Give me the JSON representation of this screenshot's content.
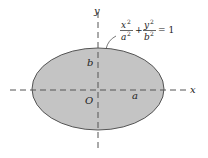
{
  "diagram": {
    "type": "ellipse",
    "fill_color": "#c4c4c4",
    "stroke_color": "#555555",
    "axis_color": "#555555",
    "labels": {
      "x_axis": "x",
      "y_axis": "y",
      "origin": "O",
      "semi_major": "a",
      "semi_minor": "b"
    },
    "equation": {
      "term1_num": "x",
      "term1_num_exp": "2",
      "term1_den": "a",
      "term1_den_exp": "2",
      "plus": "+",
      "term2_num": "y",
      "term2_num_exp": "2",
      "term2_den": "b",
      "term2_den_exp": "2",
      "equals": "= 1"
    }
  }
}
